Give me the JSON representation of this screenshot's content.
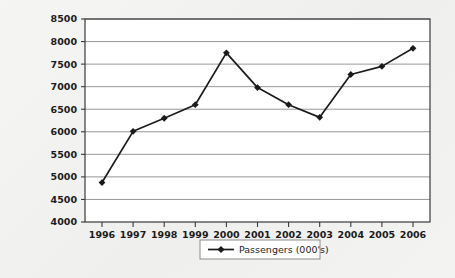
{
  "chart_data": {
    "type": "line",
    "title": "",
    "subtitle": "",
    "xlabel": "",
    "ylabel": "",
    "categories": [
      "1996",
      "1997",
      "1998",
      "1999",
      "2000",
      "2001",
      "2002",
      "2003",
      "2004",
      "2005",
      "2006"
    ],
    "series": [
      {
        "name": "Passengers (000's)",
        "marker": "diamond",
        "values": [
          4875,
          6010,
          6300,
          6600,
          7750,
          6980,
          6600,
          6320,
          7270,
          7450,
          7850
        ]
      }
    ],
    "ylim": [
      4000,
      8500
    ],
    "ytick_step": 500,
    "yticks": [
      4000,
      4500,
      5000,
      5500,
      6000,
      6500,
      7000,
      7500,
      8000,
      8500
    ],
    "ytick_labels": [
      "4000",
      "4500",
      "5000",
      "5500",
      "6000",
      "6500",
      "7000",
      "7500",
      "8000",
      "8500"
    ],
    "xtick_labels": [
      "1996",
      "1997",
      "1998",
      "1999",
      "2000",
      "2001",
      "2002",
      "2003",
      "2004",
      "2005",
      "2006"
    ],
    "grid": true,
    "grid_axis": "y",
    "legend_position": "bottom-center",
    "legend_entries": [
      "Passengers (000's)"
    ]
  },
  "style": {
    "page_background": "#f2f2f0",
    "plot_background": "#ffffff",
    "grid_color": "#8c8c8c",
    "axis_color": "#3a3a3a",
    "series_color": "#1b1b1b",
    "legend_border_color": "#8c8c8c",
    "legend_background": "#ffffff",
    "text_color": "#1b1b1b"
  }
}
